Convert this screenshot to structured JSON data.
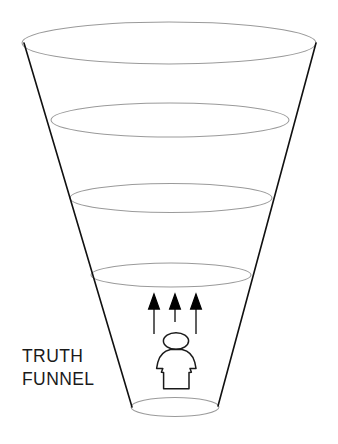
{
  "diagram": {
    "title": "Truth Funnel",
    "caption_line_1": "TRUTH",
    "caption_line_2": "FUNNEL",
    "caption_x": 22,
    "caption_line_1_y": 362,
    "caption_line_2_y": 385,
    "background_color": "#ffffff",
    "outline_color": "#111111",
    "ring_color": "#9a9a9a",
    "arrow_color": "#000000",
    "figure_stroke_color": "#1a1a1a",
    "canvas": {
      "width": 338,
      "height": 444
    },
    "funnel": {
      "shape": "inverted-cone",
      "side_left": {
        "x1": 24,
        "y1": 43,
        "x2": 132,
        "y2": 407
      },
      "side_right": {
        "x1": 316,
        "y1": 43,
        "x2": 218,
        "y2": 406
      },
      "rings": [
        {
          "name": "ring-1-top",
          "cx": 169,
          "cy": 43,
          "rx": 147,
          "ry": 21
        },
        {
          "name": "ring-2",
          "cx": 170,
          "cy": 120,
          "rx": 119,
          "ry": 17
        },
        {
          "name": "ring-3",
          "cx": 171,
          "cy": 198,
          "rx": 101,
          "ry": 14.5
        },
        {
          "name": "ring-4",
          "cx": 171,
          "cy": 275,
          "rx": 80,
          "ry": 12
        },
        {
          "name": "ring-5-bottom",
          "cx": 175,
          "cy": 407,
          "rx": 44,
          "ry": 9.5
        }
      ]
    },
    "arrows": {
      "count": 3,
      "direction": "up",
      "items": [
        {
          "name": "arrow-left",
          "x": 154,
          "tip_y": 296,
          "tail_y": 334
        },
        {
          "name": "arrow-center",
          "x": 175,
          "tip_y": 296,
          "tail_y": 322
        },
        {
          "name": "arrow-right",
          "x": 196,
          "tip_y": 296,
          "tail_y": 334
        }
      ]
    },
    "figure": {
      "name": "person",
      "head": {
        "cx": 176,
        "cy": 341,
        "rx": 12.5,
        "ry": 8
      },
      "body_y_top": 348,
      "body_y_bottom": 389
    }
  }
}
